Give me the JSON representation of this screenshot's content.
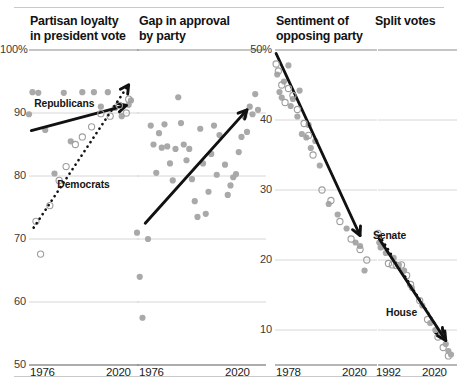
{
  "figure": {
    "background": "#ffffff",
    "point_color": "#a9a9a9",
    "open_point_color": "#9e9e9e",
    "trend_color": "#111111",
    "grid_color": "#d6d6d6",
    "axis_color": "#7a7a7a"
  },
  "chart_data": [
    {
      "type": "scatter",
      "title": "Partisan loyalty\nin president vote",
      "xlabel": "",
      "ylabel": "",
      "xlim": [
        1976,
        2020
      ],
      "ylim": [
        50,
        100
      ],
      "yticks": [
        "100%",
        "90",
        "80",
        "70",
        "60",
        "50"
      ],
      "ytick_values": [
        100,
        90,
        80,
        70,
        60,
        50
      ],
      "xticks": [
        "1976",
        "2020"
      ],
      "xtick_values": [
        1976,
        2020
      ],
      "grid": true,
      "legend": "inline-annotations",
      "annotations": [
        {
          "text": "Republicans",
          "x": 1986,
          "y": 91.5
        },
        {
          "text": "Democrats",
          "x": 1996,
          "y": 78.5
        }
      ],
      "series": [
        {
          "name": "Republicans",
          "marker": "filled",
          "trend": {
            "style": "solid",
            "arrow": true,
            "x0": 1977,
            "y0": 87.2,
            "x1": 2018,
            "y1": 91.2
          },
          "points": [
            {
              "x": 1976,
              "y": 89.8
            },
            {
              "x": 1977.5,
              "y": 93.3
            },
            {
              "x": 1980,
              "y": 93.2
            },
            {
              "x": 1983,
              "y": 87.3
            },
            {
              "x": 1987,
              "y": 80.4
            },
            {
              "x": 1991,
              "y": 93.2
            },
            {
              "x": 1994,
              "y": 85.5
            },
            {
              "x": 1999,
              "y": 93.3
            },
            {
              "x": 2004,
              "y": 93.3
            },
            {
              "x": 2007,
              "y": 91.0
            },
            {
              "x": 2010,
              "y": 93.3
            },
            {
              "x": 2013,
              "y": 90.8
            },
            {
              "x": 2016,
              "y": 89.5
            },
            {
              "x": 2019,
              "y": 91.3
            },
            {
              "x": 2020,
              "y": 92.0
            }
          ]
        },
        {
          "name": "Democrats",
          "marker": "open",
          "trend": {
            "style": "dotted",
            "arrow": true,
            "x0": 1978,
            "y0": 71.8,
            "x1": 2019,
            "y1": 94.5
          },
          "points": [
            {
              "x": 1979,
              "y": 72.8
            },
            {
              "x": 1981,
              "y": 67.6
            },
            {
              "x": 1985,
              "y": 75.3
            },
            {
              "x": 1989,
              "y": 79.3
            },
            {
              "x": 1992,
              "y": 81.5
            },
            {
              "x": 1996,
              "y": 85.0
            },
            {
              "x": 1999,
              "y": 86.2
            },
            {
              "x": 2003,
              "y": 87.8
            },
            {
              "x": 2007,
              "y": 89.9
            },
            {
              "x": 2011,
              "y": 89.5
            },
            {
              "x": 2015,
              "y": 91.2
            },
            {
              "x": 2018,
              "y": 90.0
            },
            {
              "x": 2019,
              "y": 92.2
            }
          ]
        }
      ]
    },
    {
      "type": "scatter",
      "title": "Gap in approval\nby party",
      "xlabel": "",
      "ylabel": "",
      "xlim": [
        1976,
        2020
      ],
      "ylim": [
        50,
        100
      ],
      "yticks": [],
      "xticks": [
        "1976",
        "2020"
      ],
      "xtick_values": [
        1976,
        2020
      ],
      "grid": true,
      "series": [
        {
          "name": "Approval gap",
          "marker": "filled",
          "trend": {
            "style": "solid",
            "arrow": true,
            "x0": 1979,
            "y0": 72.5,
            "x1": 2016,
            "y1": 90.5
          },
          "points": [
            {
              "x": 1976,
              "y": 71.0
            },
            {
              "x": 1977,
              "y": 64.0
            },
            {
              "x": 1978,
              "y": 57.5
            },
            {
              "x": 1980,
              "y": 70.0
            },
            {
              "x": 1981,
              "y": 88.0
            },
            {
              "x": 1982,
              "y": 85.0
            },
            {
              "x": 1983,
              "y": 80.5
            },
            {
              "x": 1984,
              "y": 86.8
            },
            {
              "x": 1985,
              "y": 84.5
            },
            {
              "x": 1986,
              "y": 88.2
            },
            {
              "x": 1987,
              "y": 84.7
            },
            {
              "x": 1988,
              "y": 82.0
            },
            {
              "x": 1989,
              "y": 79.3
            },
            {
              "x": 1990,
              "y": 84.3
            },
            {
              "x": 1991,
              "y": 92.5
            },
            {
              "x": 1992,
              "y": 88.4
            },
            {
              "x": 1993,
              "y": 85.0
            },
            {
              "x": 1994,
              "y": 82.5
            },
            {
              "x": 1995,
              "y": 84.3
            },
            {
              "x": 1996,
              "y": 79.5
            },
            {
              "x": 1997,
              "y": 76.0
            },
            {
              "x": 1998,
              "y": 73.5
            },
            {
              "x": 1999,
              "y": 87.5
            },
            {
              "x": 2000,
              "y": 82.0
            },
            {
              "x": 2001,
              "y": 74.0
            },
            {
              "x": 2002,
              "y": 77.5
            },
            {
              "x": 2003,
              "y": 83.5
            },
            {
              "x": 2004,
              "y": 88.0
            },
            {
              "x": 2005,
              "y": 80.2
            },
            {
              "x": 2006,
              "y": 86.5
            },
            {
              "x": 2008,
              "y": 81.8
            },
            {
              "x": 2009,
              "y": 77.0
            },
            {
              "x": 2010,
              "y": 78.5
            },
            {
              "x": 2011,
              "y": 79.8
            },
            {
              "x": 2012,
              "y": 80.3
            },
            {
              "x": 2013,
              "y": 83.8
            },
            {
              "x": 2014,
              "y": 86.2
            },
            {
              "x": 2015,
              "y": 89.5
            },
            {
              "x": 2016,
              "y": 87.0
            },
            {
              "x": 2017,
              "y": 91.0
            },
            {
              "x": 2018,
              "y": 89.8
            },
            {
              "x": 2019,
              "y": 93.0
            },
            {
              "x": 2020,
              "y": 90.5
            }
          ]
        }
      ]
    },
    {
      "type": "scatter",
      "title": "Sentiment of\nopposing party",
      "xlabel": "",
      "ylabel": "",
      "xlim": [
        1978,
        2020
      ],
      "ylim": [
        5,
        50
      ],
      "yticks": [
        "50%",
        "40",
        "30",
        "20",
        "10"
      ],
      "ytick_values": [
        50,
        40,
        30,
        20,
        10
      ],
      "xticks": [
        "1978",
        "2020"
      ],
      "xtick_values": [
        1978,
        2020
      ],
      "grid": true,
      "series": [
        {
          "name": "Opposing party sentiment (A)",
          "marker": "filled",
          "trend": {
            "style": "solid",
            "arrow": true,
            "x0": 1978.5,
            "y0": 49.5,
            "x1": 2016,
            "y1": 23.5
          },
          "points": [
            {
              "x": 1979,
              "y": 46.5
            },
            {
              "x": 1980,
              "y": 44.0
            },
            {
              "x": 1981,
              "y": 43.2
            },
            {
              "x": 1982,
              "y": 45.5
            },
            {
              "x": 1984,
              "y": 47.8
            },
            {
              "x": 1985,
              "y": 42.0
            },
            {
              "x": 1986,
              "y": 43.0
            },
            {
              "x": 1988,
              "y": 40.5
            },
            {
              "x": 1989,
              "y": 44.2
            },
            {
              "x": 1990,
              "y": 38.0
            },
            {
              "x": 1992,
              "y": 37.5
            },
            {
              "x": 1993,
              "y": 39.3
            },
            {
              "x": 1994,
              "y": 36.0
            },
            {
              "x": 1996,
              "y": 37.0
            },
            {
              "x": 1998,
              "y": 33.5
            },
            {
              "x": 2002,
              "y": 28.0
            },
            {
              "x": 2006,
              "y": 26.5
            },
            {
              "x": 2010,
              "y": 24.5
            },
            {
              "x": 2014,
              "y": 22.5
            },
            {
              "x": 2016,
              "y": 22.0
            },
            {
              "x": 2018,
              "y": 18.5
            }
          ]
        },
        {
          "name": "Opposing party sentiment (B)",
          "marker": "open",
          "points": [
            {
              "x": 1978.5,
              "y": 48.0
            },
            {
              "x": 1979.5,
              "y": 47.0
            },
            {
              "x": 1981,
              "y": 45.0
            },
            {
              "x": 1982.5,
              "y": 42.5
            },
            {
              "x": 1984,
              "y": 44.5
            },
            {
              "x": 1986,
              "y": 43.5
            },
            {
              "x": 1988,
              "y": 41.5
            },
            {
              "x": 1991,
              "y": 39.5
            },
            {
              "x": 1993,
              "y": 37.8
            },
            {
              "x": 1995,
              "y": 35.0
            },
            {
              "x": 1999,
              "y": 30.0
            },
            {
              "x": 2003,
              "y": 28.5
            },
            {
              "x": 2007,
              "y": 25.5
            },
            {
              "x": 2012,
              "y": 23.0
            },
            {
              "x": 2016,
              "y": 21.5
            },
            {
              "x": 2019,
              "y": 20.0
            }
          ]
        }
      ]
    },
    {
      "type": "scatter",
      "title": "Split votes",
      "xlabel": "",
      "ylabel": "",
      "xlim": [
        1992,
        2020
      ],
      "ylim": [
        5,
        50
      ],
      "yticks": [],
      "xticks": [
        "1992",
        "2020"
      ],
      "xtick_values": [
        1992,
        2020
      ],
      "grid": true,
      "annotations": [
        {
          "text": "Senate",
          "x": 1997,
          "y": 23.5
        },
        {
          "text": "House",
          "x": 2002,
          "y": 12.5
        }
      ],
      "series": [
        {
          "name": "Senate",
          "marker": "open",
          "trend": {
            "style": "dotted",
            "arrow": true,
            "x0": 1992.5,
            "y0": 23.5,
            "x1": 2017,
            "y1": 9.0
          },
          "points": [
            {
              "x": 1992,
              "y": 23.8
            },
            {
              "x": 1993.5,
              "y": 22.0
            },
            {
              "x": 1996,
              "y": 19.5
            },
            {
              "x": 1997.5,
              "y": 19.3
            },
            {
              "x": 1999,
              "y": 19.2
            },
            {
              "x": 2001,
              "y": 19.3
            },
            {
              "x": 2003,
              "y": 17.8
            },
            {
              "x": 2004.5,
              "y": 16.5
            },
            {
              "x": 2008,
              "y": 14.2
            },
            {
              "x": 2011,
              "y": 11.5
            },
            {
              "x": 2015,
              "y": 9.0
            },
            {
              "x": 2017,
              "y": 7.5
            },
            {
              "x": 2019,
              "y": 6.3
            }
          ]
        },
        {
          "name": "House",
          "marker": "filled",
          "trend": {
            "style": "solid",
            "arrow": true,
            "x0": 1992.5,
            "y0": 23.0,
            "x1": 2018,
            "y1": 8.5
          },
          "points": [
            {
              "x": 1992.5,
              "y": 22.5
            },
            {
              "x": 1993,
              "y": 21.8
            },
            {
              "x": 1995,
              "y": 21.0
            },
            {
              "x": 1998,
              "y": 20.3
            },
            {
              "x": 2000,
              "y": 19.3
            },
            {
              "x": 2002,
              "y": 18.5
            },
            {
              "x": 2005,
              "y": 16.0
            },
            {
              "x": 2009,
              "y": 13.5
            },
            {
              "x": 2012,
              "y": 11.0
            },
            {
              "x": 2014,
              "y": 10.0
            },
            {
              "x": 2016,
              "y": 9.2
            },
            {
              "x": 2018,
              "y": 8.0
            },
            {
              "x": 2019,
              "y": 7.0
            },
            {
              "x": 2020,
              "y": 6.5
            }
          ]
        }
      ]
    }
  ]
}
